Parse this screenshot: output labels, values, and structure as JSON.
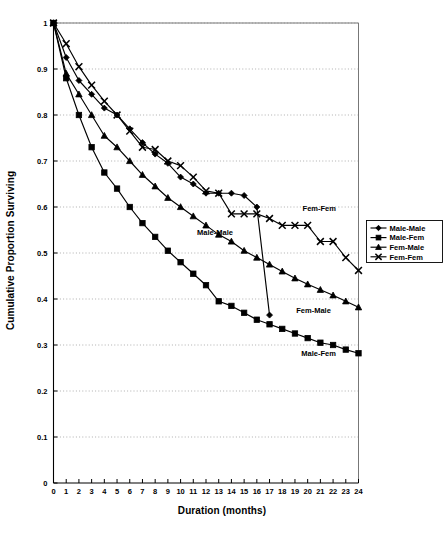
{
  "chart_data": {
    "type": "line",
    "title": "",
    "xlabel": "Duration (months)",
    "ylabel": "Cumulative Proportion Surviving",
    "xlim": [
      0,
      24
    ],
    "ylim": [
      0,
      1
    ],
    "xticks": [
      "0",
      "1",
      "2",
      "3",
      "4",
      "5",
      "6",
      "7",
      "8",
      "9",
      "10",
      "11",
      "12",
      "13",
      "14",
      "15",
      "16",
      "17",
      "18",
      "19",
      "20",
      "21",
      "22",
      "23",
      "24"
    ],
    "yticks": [
      "0",
      "0.1",
      "0.2",
      "0.3",
      "0.4",
      "0.5",
      "0.6",
      "0.7",
      "0.8",
      "0.9",
      "1"
    ],
    "grid": "horizontal-dotted",
    "legend_position": "right",
    "x": [
      0,
      1,
      2,
      3,
      4,
      5,
      6,
      7,
      8,
      9,
      10,
      11,
      12,
      13,
      14,
      15,
      16,
      17,
      18,
      19,
      20,
      21,
      22,
      23,
      24
    ],
    "series": [
      {
        "name": "Male-Male",
        "marker": "diamond",
        "values": [
          1.0,
          0.925,
          0.875,
          0.845,
          0.815,
          0.8,
          0.77,
          0.74,
          0.715,
          0.695,
          0.665,
          0.65,
          0.63,
          0.63,
          0.63,
          0.625,
          0.6,
          0.365,
          null,
          null,
          null,
          null,
          null,
          null,
          null
        ]
      },
      {
        "name": "Male-Fem",
        "marker": "square",
        "values": [
          1.0,
          0.88,
          0.8,
          0.73,
          0.675,
          0.64,
          0.6,
          0.565,
          0.535,
          0.505,
          0.48,
          0.455,
          0.43,
          0.395,
          0.385,
          0.37,
          0.355,
          0.345,
          0.335,
          0.325,
          0.315,
          0.305,
          0.3,
          0.29,
          0.282
        ]
      },
      {
        "name": "Fem-Male",
        "marker": "triangle",
        "values": [
          1.0,
          0.89,
          0.845,
          0.8,
          0.755,
          0.73,
          0.7,
          0.67,
          0.645,
          0.62,
          0.6,
          0.58,
          0.56,
          0.54,
          0.525,
          0.505,
          0.49,
          0.475,
          0.46,
          0.445,
          0.432,
          0.42,
          0.408,
          0.395,
          0.382
        ]
      },
      {
        "name": "Fem-Fem",
        "marker": "cross",
        "values": [
          1.0,
          0.955,
          0.905,
          0.865,
          0.83,
          0.8,
          0.765,
          0.73,
          0.725,
          0.7,
          0.69,
          0.665,
          0.635,
          0.63,
          0.585,
          0.585,
          0.585,
          0.575,
          0.56,
          0.56,
          0.56,
          0.525,
          0.525,
          0.49,
          0.462
        ]
      }
    ],
    "annotations": [
      {
        "text": "Male-Male",
        "x": 11.3,
        "y": 0.54
      },
      {
        "text": "Fem-Fem",
        "x": 19.6,
        "y": 0.592
      },
      {
        "text": "Fem-Male",
        "x": 19.1,
        "y": 0.37
      },
      {
        "text": "Male-Fem",
        "x": 19.5,
        "y": 0.277
      }
    ]
  },
  "legend": {
    "items": [
      {
        "label": "Male-Male",
        "marker": "diamond"
      },
      {
        "label": "Male-Fem",
        "marker": "square"
      },
      {
        "label": "Fem-Male",
        "marker": "triangle"
      },
      {
        "label": "Fem-Fem",
        "marker": "cross"
      }
    ]
  },
  "colors": {
    "line": "#000000",
    "grid": "#9a9a9a",
    "axis": "#000000",
    "background": "#ffffff"
  }
}
